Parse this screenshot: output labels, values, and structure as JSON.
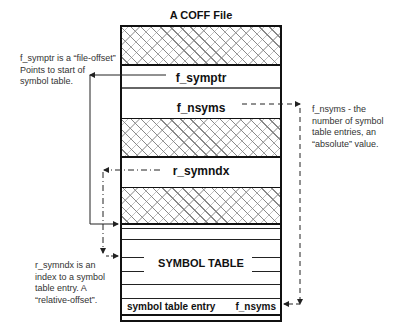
{
  "title": "A COFF File",
  "segments": {
    "f_symptr": "f_symptr",
    "f_nsyms": "f_nsyms",
    "r_symndx": "r_symndx",
    "symbol_table": "SYMBOL TABLE",
    "entry_left": "symbol table entry",
    "entry_right": "f_nsyms"
  },
  "notes": {
    "f_symptr": [
      "f_symptr is a “file-offset”",
      "Points to start of",
      "symbol table."
    ],
    "f_nsyms": [
      "f_nsyms - the",
      "number of symbol",
      "table entries, an",
      "“absolute” value."
    ],
    "r_symndx": [
      "r_symndx is an",
      "index to a symbol",
      "table entry.  A",
      "“relative-offset”."
    ]
  }
}
